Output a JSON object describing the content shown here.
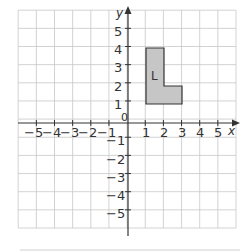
{
  "axes": {
    "x_label": "x",
    "y_label": "y",
    "origin_label": "0",
    "x_ticks": [
      "−5",
      "−4",
      "−3",
      "−2",
      "−1",
      "1",
      "2",
      "3",
      "4",
      "5"
    ],
    "y_ticks_pos": [
      "1",
      "2",
      "3",
      "4",
      "5"
    ],
    "y_ticks_neg": [
      "−1",
      "−2",
      "−3",
      "−4",
      "−5"
    ],
    "range": [
      -6,
      6
    ]
  },
  "shape": {
    "label": "L",
    "vertices": [
      [
        1,
        1
      ],
      [
        1,
        4
      ],
      [
        2,
        4
      ],
      [
        2,
        2
      ],
      [
        3,
        2
      ],
      [
        3,
        1
      ]
    ],
    "fill": "#c6c6c6"
  }
}
